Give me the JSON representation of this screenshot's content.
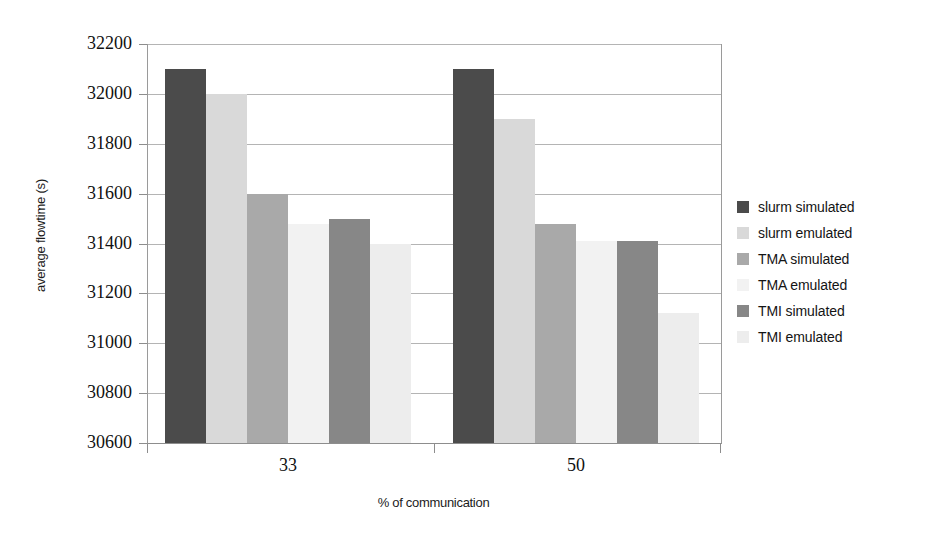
{
  "chart_data": {
    "type": "bar",
    "title": "",
    "xlabel": "% of communication",
    "ylabel": "average flowtime (s)",
    "categories": [
      "33",
      "50"
    ],
    "ylim": [
      30600,
      32200
    ],
    "ytick_step": 200,
    "yticks": [
      32200,
      32000,
      31800,
      31600,
      31400,
      31200,
      31000,
      30800,
      30600
    ],
    "grid": true,
    "legend_position": "right",
    "series": [
      {
        "name": "slurm simulated",
        "color": "#4b4b4b",
        "values": [
          32100,
          32100
        ]
      },
      {
        "name": "slurm emulated",
        "color": "#d9d9d9",
        "values": [
          32000,
          31900
        ]
      },
      {
        "name": "TMA simulated",
        "color": "#a9a9a9",
        "values": [
          31600,
          31480
        ]
      },
      {
        "name": "TMA emulated",
        "color": "#f2f2f2",
        "values": [
          31480,
          31410
        ]
      },
      {
        "name": "TMI simulated",
        "color": "#878787",
        "values": [
          31500,
          31410
        ]
      },
      {
        "name": "TMI emulated",
        "color": "#ededed",
        "values": [
          31400,
          31120
        ]
      }
    ]
  },
  "axis": {
    "y_title": "average flowtime (s)",
    "x_title": "% of communication",
    "y_tick_labels": [
      "32200",
      "32000",
      "31800",
      "31600",
      "31400",
      "31200",
      "31000",
      "30800",
      "30600"
    ],
    "x_tick_labels": [
      "33",
      "50"
    ]
  },
  "legend": {
    "items": [
      {
        "label": "slurm simulated",
        "color": "#4b4b4b"
      },
      {
        "label": "slurm emulated",
        "color": "#d9d9d9"
      },
      {
        "label": "TMA simulated",
        "color": "#a9a9a9"
      },
      {
        "label": "TMA emulated",
        "color": "#f2f2f2"
      },
      {
        "label": "TMI simulated",
        "color": "#878787"
      },
      {
        "label": "TMI emulated",
        "color": "#ededed"
      }
    ]
  },
  "plot": {
    "background": "#ffffff",
    "gridline_color": "#b4b4b4",
    "axis_color": "#8d8d8d"
  }
}
